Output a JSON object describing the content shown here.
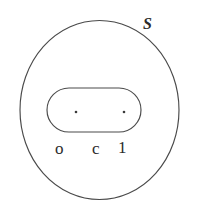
{
  "figure": {
    "kind": "topology-diagram",
    "background_color": "#ffffff",
    "stroke_color": "#4a4a4a",
    "text_color": "#2b2b2b",
    "outer_region": {
      "shape_name": "circle",
      "label": "S",
      "label_position": "top-right-outside"
    },
    "inner_region": {
      "shape_name": "stadium",
      "label": ""
    },
    "points": [
      {
        "name": "left-point",
        "label": "o"
      },
      {
        "name": "middle-point",
        "label": "c"
      },
      {
        "name": "right-point",
        "label": "1"
      }
    ],
    "dots": [
      {
        "name": "left-dot"
      },
      {
        "name": "right-dot"
      }
    ]
  }
}
